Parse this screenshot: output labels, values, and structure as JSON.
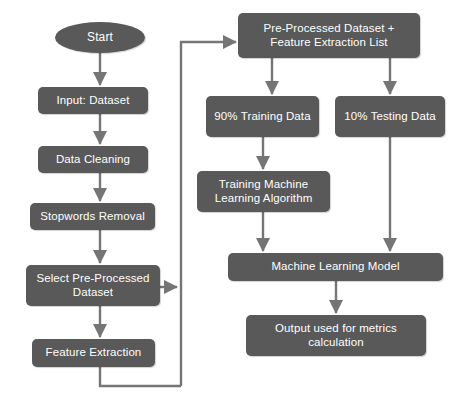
{
  "diagram": {
    "background_color": "#ffffff",
    "node_fill_color": "#595959",
    "node_text_color": "#ffffff",
    "edge_color": "#757575"
  },
  "nodes": {
    "start": {
      "label": "Start",
      "shape": "ellipse"
    },
    "input_dataset": {
      "label": "Input: Dataset",
      "shape": "rounded-rect"
    },
    "data_cleaning": {
      "label": "Data Cleaning",
      "shape": "rounded-rect"
    },
    "stopwords_removal": {
      "label": "Stopwords Removal",
      "shape": "rounded-rect"
    },
    "select_preprocessed_dataset": {
      "label": "Select Pre-Processed Dataset",
      "shape": "rounded-rect"
    },
    "feature_extraction": {
      "label": "Feature Extraction",
      "shape": "rounded-rect"
    },
    "preprocessed_dataset_plus_list": {
      "label": "Pre-Processed Dataset + Feature Extraction List",
      "shape": "rounded-rect"
    },
    "training_data": {
      "label": "90% Training Data",
      "shape": "rounded-rect"
    },
    "testing_data": {
      "label": "10% Testing Data",
      "shape": "rounded-rect"
    },
    "training_ml_algorithm": {
      "label": "Training Machine Learning Algorithm",
      "shape": "rounded-rect"
    },
    "machine_learning_model": {
      "label": "Machine Learning Model",
      "shape": "rounded-rect"
    },
    "output_metrics": {
      "label": "Output used for metrics calculation",
      "shape": "rounded-rect"
    }
  },
  "edges": [
    {
      "from": "start",
      "to": "input_dataset",
      "arrow": true
    },
    {
      "from": "input_dataset",
      "to": "data_cleaning",
      "arrow": true
    },
    {
      "from": "data_cleaning",
      "to": "stopwords_removal",
      "arrow": true
    },
    {
      "from": "stopwords_removal",
      "to": "select_preprocessed_dataset",
      "arrow": true
    },
    {
      "from": "select_preprocessed_dataset",
      "to": "feature_extraction",
      "arrow": true
    },
    {
      "from": "select_preprocessed_dataset",
      "to": "loop_bus",
      "arrow": true
    },
    {
      "from": "feature_extraction",
      "to": "loop_bus",
      "arrow": false
    },
    {
      "from": "loop_bus",
      "to": "preprocessed_dataset_plus_list",
      "arrow": true
    },
    {
      "from": "preprocessed_dataset_plus_list",
      "to": "training_data",
      "arrow": true
    },
    {
      "from": "preprocessed_dataset_plus_list",
      "to": "testing_data",
      "arrow": true
    },
    {
      "from": "training_data",
      "to": "training_ml_algorithm",
      "arrow": true
    },
    {
      "from": "training_ml_algorithm",
      "to": "machine_learning_model",
      "arrow": true
    },
    {
      "from": "testing_data",
      "to": "machine_learning_model",
      "arrow": true
    },
    {
      "from": "machine_learning_model",
      "to": "output_metrics",
      "arrow": true
    }
  ]
}
